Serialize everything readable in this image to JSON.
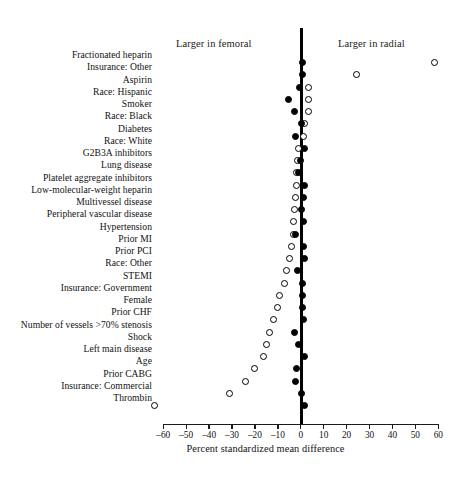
{
  "figure": {
    "annotations": {
      "left": "Larger in femoral",
      "right": "Larger in radial"
    }
  },
  "chart_data": {
    "type": "scatter",
    "title": "",
    "xlabel": "Percent standardized mean difference",
    "ylabel": "",
    "xlim": [
      -60,
      60
    ],
    "xticks": [
      -60,
      -50,
      -40,
      -30,
      -20,
      -10,
      0,
      10,
      20,
      30,
      40,
      50,
      60
    ],
    "xticklabels": [
      "–60",
      "–50",
      "–40",
      "–30",
      "–20",
      "–10",
      "0",
      "10",
      "20",
      "30",
      "40",
      "50",
      "60"
    ],
    "grid": false,
    "legend_position": "none",
    "reference_line": 0,
    "annotations": [
      "Larger in femoral",
      "Larger in radial"
    ],
    "series": [
      {
        "name": "open",
        "marker": "open-circle"
      },
      {
        "name": "filled",
        "marker": "filled-circle"
      }
    ],
    "categories": [
      "Fractionated heparin",
      "Insurance: Other",
      "Aspirin",
      "Race: Hispanic",
      "Smoker",
      "Race: Black",
      "Diabetes",
      "Race: White",
      "G2B3A inhibitors",
      "Lung disease",
      "Platelet aggregate inhibitors",
      "Low-molecular-weight heparin",
      "Multivessel disease",
      "Peripheral vascular disease",
      "Hypertension",
      "Prior MI",
      "Prior PCI",
      "Race: Other",
      "STEMI",
      "Insurance: Government",
      "Female",
      "Prior CHF",
      "Number of vessels >70% stenosis",
      "Shock",
      "Left main disease",
      "Age",
      "Prior CABG",
      "Insurance: Commercial",
      "Thrombin"
    ],
    "points": [
      {
        "label": "Fractionated heparin",
        "open": 58.5,
        "filled": 0.6
      },
      {
        "label": "Insurance: Other",
        "open": 24.5,
        "filled": 0.8
      },
      {
        "label": "Aspirin",
        "open": 3.2,
        "filled": -0.4
      },
      {
        "label": "Race: Hispanic",
        "open": 3.4,
        "filled": -5.4
      },
      {
        "label": "Smoker",
        "open": 3.4,
        "filled": -2.8
      },
      {
        "label": "Race: Black",
        "open": 1.4,
        "filled": 0.3
      },
      {
        "label": "Diabetes",
        "open": 1.0,
        "filled": -2.5
      },
      {
        "label": "Race: White",
        "open": -1.1,
        "filled": 1.6
      },
      {
        "label": "G2B3A inhibitors",
        "open": -1.5,
        "filled": 0.0
      },
      {
        "label": "Lung disease",
        "open": -1.7,
        "filled": -1.0
      },
      {
        "label": "Platelet aggregate inhibitors",
        "open": -2.0,
        "filled": 1.5
      },
      {
        "label": "Low-molecular-weight heparin",
        "open": -2.4,
        "filled": 1.3
      },
      {
        "label": "Multivessel disease",
        "open": -2.6,
        "filled": 0.5
      },
      {
        "label": "Peripheral vascular disease",
        "open": -3.0,
        "filled": 1.3
      },
      {
        "label": "Hypertension",
        "open": -3.4,
        "filled": -2.1
      },
      {
        "label": "Prior MI",
        "open": -4.1,
        "filled": 1.2
      },
      {
        "label": "Prior PCI",
        "open": -5.0,
        "filled": 1.5
      },
      {
        "label": "Race: Other",
        "open": -6.1,
        "filled": -1.6
      },
      {
        "label": "STEMI",
        "open": -7.3,
        "filled": 0.9
      },
      {
        "label": "Insurance: Government",
        "open": -9.1,
        "filled": 0.9
      },
      {
        "label": "Female",
        "open": -10.3,
        "filled": 0.8
      },
      {
        "label": "Prior CHF",
        "open": -11.7,
        "filled": 1.2
      },
      {
        "label": "Number of vessels >70% stenosis",
        "open": -13.6,
        "filled": -2.6
      },
      {
        "label": "Shock",
        "open": -14.8,
        "filled": -1.0
      },
      {
        "label": "Left main disease",
        "open": -16.4,
        "filled": 1.7
      },
      {
        "label": "Age",
        "open": -20.1,
        "filled": -1.8
      },
      {
        "label": "Prior CABG",
        "open": -24.3,
        "filled": -2.2
      },
      {
        "label": "Insurance: Commercial",
        "open": -31.0,
        "filled": 0.2
      },
      {
        "label": "Thrombin",
        "open": -64.0,
        "filled": 1.4
      }
    ]
  }
}
